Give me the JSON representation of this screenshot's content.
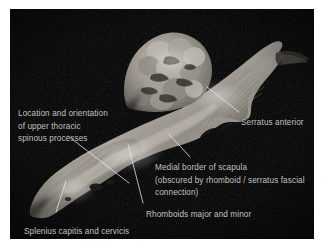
{
  "figure": {
    "kind": "anatomical-dissection-photograph",
    "background_color": "#000000",
    "page_color": "#ffffff",
    "label_color": "#c6c6c6",
    "leader_color": "#e8e8e8"
  },
  "annotations": [
    {
      "id": "location-orientation",
      "text": "Location and orientation\nof upper thoracic\nspinous processes",
      "lines": [
        "Location and orientation",
        "of upper thoracic",
        "spinous processes"
      ],
      "x": 18,
      "y": 108
    },
    {
      "id": "serratus-anterior",
      "text": "Serratus anterior",
      "lines": [
        "Serratus anterior"
      ],
      "x": 241,
      "y": 117
    },
    {
      "id": "medial-border-scapula",
      "text": "Medial border of scapula\n(obscured by rhomboid / serratus fascial\nconnection)",
      "lines": [
        "Medial border of scapula",
        "(obscured by rhomboid / serratus fascial",
        "connection)"
      ],
      "x": 155,
      "y": 162
    },
    {
      "id": "rhomboids",
      "text": "Rhomboids major and minor",
      "lines": [
        "Rhomboids major and minor"
      ],
      "x": 146,
      "y": 209
    },
    {
      "id": "splenius",
      "text": "Splenius capitis and cervicis",
      "lines": [
        "Splenius capitis and cervicis"
      ],
      "x": 24,
      "y": 226
    }
  ],
  "leader_lines": [
    {
      "id": "leader-serratus-anterior",
      "x1": 239,
      "x2": 206,
      "y1": 117,
      "y2": 91
    },
    {
      "id": "leader-medial-border",
      "x1": 190,
      "x2": 169,
      "y1": 162,
      "y2": 139
    },
    {
      "id": "leader-rhomboids",
      "x1": 143,
      "x2": 128,
      "y1": 207,
      "y2": 148
    },
    {
      "id": "leader-spinous",
      "x1": 68,
      "x2": 129,
      "y1": 140,
      "y2": 187
    },
    {
      "id": "leader-splenius",
      "x1": 66,
      "x2": 56,
      "y1": 185,
      "y2": 216
    }
  ]
}
